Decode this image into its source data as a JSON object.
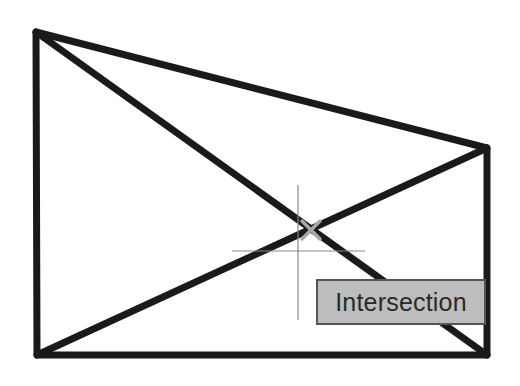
{
  "drawing": {
    "shape": "quadrilateral",
    "vertices": {
      "top_left": [
        36,
        32
      ],
      "top_right": [
        487,
        148
      ],
      "bottom_right": [
        487,
        355
      ],
      "bottom_left": [
        37,
        355
      ]
    },
    "diagonals": [
      {
        "from": "top_left",
        "to": "bottom_right"
      },
      {
        "from": "bottom_left",
        "to": "top_right"
      }
    ],
    "stroke_color": "#1a1a1a",
    "stroke_width": 7
  },
  "cursor": {
    "type": "crosshair",
    "x": 298,
    "y": 251,
    "color": "#888888"
  },
  "snap_marker": {
    "type": "intersection",
    "x": 311,
    "y": 230,
    "color": "#a0a0a0"
  },
  "tooltip": {
    "label": "Intersection"
  }
}
